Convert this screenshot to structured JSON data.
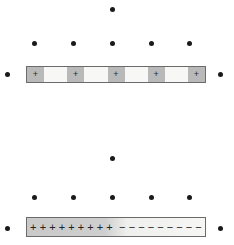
{
  "figure": {
    "width": 234,
    "height": 245,
    "background_color": "#ffffff",
    "dot_color": "#1a1a1a",
    "bar_border_color": "#6b6b6b"
  },
  "dots": [
    {
      "name": "dot-top-center",
      "x": 110,
      "y": 7
    },
    {
      "name": "dot-upper-row-1",
      "x": 32,
      "y": 41
    },
    {
      "name": "dot-upper-row-2",
      "x": 71,
      "y": 41
    },
    {
      "name": "dot-upper-row-3",
      "x": 110,
      "y": 41
    },
    {
      "name": "dot-upper-row-4",
      "x": 149,
      "y": 41
    },
    {
      "name": "dot-upper-row-5",
      "x": 187,
      "y": 41
    },
    {
      "name": "dot-left-of-top-bar",
      "x": 5,
      "y": 72
    },
    {
      "name": "dot-right-of-top-bar",
      "x": 218,
      "y": 72
    },
    {
      "name": "dot-middle-center",
      "x": 110,
      "y": 156
    },
    {
      "name": "dot-lower-row-1",
      "x": 32,
      "y": 195
    },
    {
      "name": "dot-lower-row-2",
      "x": 71,
      "y": 195
    },
    {
      "name": "dot-lower-row-3",
      "x": 110,
      "y": 195
    },
    {
      "name": "dot-lower-row-4",
      "x": 149,
      "y": 195
    },
    {
      "name": "dot-lower-row-5",
      "x": 187,
      "y": 195
    },
    {
      "name": "dot-left-of-bottom-bar",
      "x": 5,
      "y": 226
    },
    {
      "name": "dot-right-of-bottom-bar",
      "x": 218,
      "y": 226
    }
  ],
  "top_bar": {
    "label": "top-charged-bar",
    "charged_cell_color": "#b9b9b9",
    "neutral_cell_color": "#f7f7f5",
    "cells": [
      {
        "type": "charged",
        "sign": "+"
      },
      {
        "type": "neutral",
        "sign": ""
      },
      {
        "type": "charged",
        "sign": "+"
      },
      {
        "type": "neutral",
        "sign": ""
      },
      {
        "type": "charged",
        "sign": "+"
      },
      {
        "type": "neutral",
        "sign": ""
      },
      {
        "type": "charged",
        "sign": "+"
      },
      {
        "type": "neutral",
        "sign": ""
      },
      {
        "type": "charged",
        "sign": "+"
      }
    ]
  },
  "bottom_bar": {
    "label": "bottom-polarized-bar",
    "positive_half": {
      "sign": "+",
      "count": 9,
      "signs": [
        "+",
        "+",
        "+",
        "+",
        "+",
        "+",
        "+",
        "+",
        "+"
      ]
    },
    "negative_half": {
      "sign": "−",
      "count": 9,
      "signs": [
        "−",
        "−",
        "−",
        "−",
        "−",
        "−",
        "−",
        "−",
        "−"
      ]
    }
  }
}
